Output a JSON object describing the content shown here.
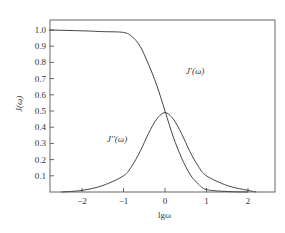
{
  "chart_data": {
    "type": "line",
    "title": "",
    "xlabel": "lgω",
    "ylabel": "J(ω)",
    "xlim": [
      -2.8,
      2.6
    ],
    "ylim": [
      0,
      1.07
    ],
    "grid": false,
    "legend": "inline labels",
    "x_ticks": [
      "-2",
      "-1",
      "0",
      "1",
      "2"
    ],
    "y_ticks": [
      "0.1",
      "0.2",
      "0.3",
      "0.4",
      "0.5",
      "0.6",
      "0.7",
      "0.8",
      "0.9",
      "1.0"
    ],
    "series": [
      {
        "name": "J'(ω)",
        "x": [
          -2.8,
          -2.0,
          -1.5,
          -1.0,
          -0.8,
          -0.6,
          -0.4,
          -0.2,
          0.0,
          0.2,
          0.4,
          0.6,
          0.8,
          1.0,
          1.5,
          2.0
        ],
        "y": [
          1.0,
          0.995,
          0.99,
          0.985,
          0.96,
          0.9,
          0.79,
          0.66,
          0.5,
          0.34,
          0.21,
          0.11,
          0.05,
          0.015,
          0.003,
          0.0
        ]
      },
      {
        "name": "J''(ω)",
        "x": [
          -2.5,
          -2.0,
          -1.5,
          -1.0,
          -0.8,
          -0.6,
          -0.4,
          -0.2,
          0.0,
          0.2,
          0.4,
          0.6,
          0.8,
          1.0,
          1.5,
          2.0,
          2.2
        ],
        "y": [
          0.0,
          0.01,
          0.04,
          0.1,
          0.16,
          0.25,
          0.36,
          0.45,
          0.49,
          0.45,
          0.36,
          0.25,
          0.16,
          0.1,
          0.04,
          0.01,
          0.0
        ]
      }
    ],
    "annotations": [
      {
        "text": "J'(ω)",
        "near_x": 0.3,
        "near_y": 0.74
      },
      {
        "text": "J''(ω)",
        "near_x": -0.7,
        "near_y": 0.33
      }
    ]
  }
}
